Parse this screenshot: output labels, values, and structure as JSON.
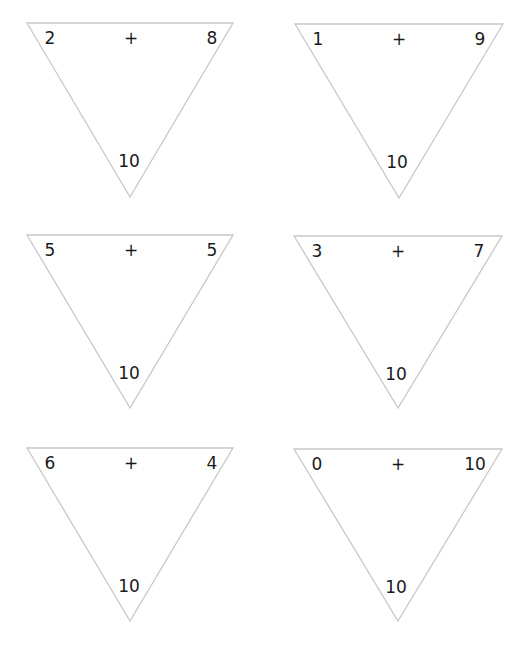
{
  "worksheet": {
    "line_color": "#c8c8c8",
    "text_color": "#1a1a1a",
    "triangles": [
      {
        "left": "2",
        "operator": "+",
        "right": "8",
        "sum": "10"
      },
      {
        "left": "1",
        "operator": "+",
        "right": "9",
        "sum": "10"
      },
      {
        "left": "5",
        "operator": "+",
        "right": "5",
        "sum": "10"
      },
      {
        "left": "3",
        "operator": "+",
        "right": "7",
        "sum": "10"
      },
      {
        "left": "6",
        "operator": "+",
        "right": "4",
        "sum": "10"
      },
      {
        "left": "0",
        "operator": "+",
        "right": "10",
        "sum": "10"
      }
    ]
  }
}
